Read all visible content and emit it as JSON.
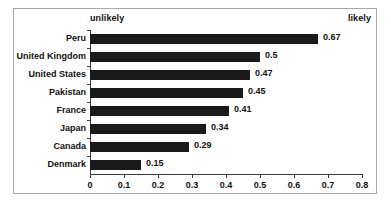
{
  "chart_data": {
    "type": "bar",
    "orientation": "horizontal",
    "title": "",
    "subtitle": "",
    "xlabel": "",
    "ylabel": "",
    "xlim": [
      0,
      0.8
    ],
    "xticks": [
      "0",
      "0.1",
      "0.2",
      "0.3",
      "0.4",
      "0.5",
      "0.6",
      "0.7",
      "0.8"
    ],
    "xtick_values": [
      0,
      0.1,
      0.2,
      0.3,
      0.4,
      0.5,
      0.6,
      0.7,
      0.8
    ],
    "grid": false,
    "legend": null,
    "categories": [
      "Peru",
      "United Kingdom",
      "United States",
      "Pakistan",
      "France",
      "Japan",
      "Canada",
      "Denmark"
    ],
    "values": [
      0.67,
      0.5,
      0.47,
      0.45,
      0.41,
      0.34,
      0.29,
      0.15
    ],
    "value_labels": [
      "0.67",
      "0.5",
      "0.47",
      "0.45",
      "0.41",
      "0.34",
      "0.29",
      "0.15"
    ],
    "bar_color": "#1a1a1a",
    "axis_color": "#3a3a3a",
    "annotations": {
      "left_anchor": "unlikely",
      "right_anchor": "likely"
    }
  },
  "frame": {
    "border_color": "#a8a8a8"
  }
}
